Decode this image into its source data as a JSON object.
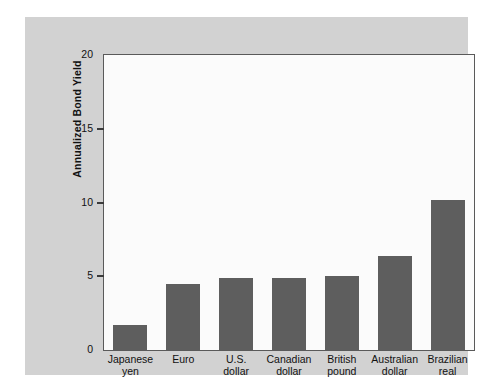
{
  "chart_data": {
    "type": "bar",
    "title": "",
    "subtitle": "",
    "xlabel": "",
    "ylabel": "Annualized Bond Yield",
    "ylim": [
      0,
      20
    ],
    "yticks": [
      0,
      5,
      10,
      15,
      20
    ],
    "ytick_labels": [
      "0",
      "5",
      "10",
      "15",
      "20"
    ],
    "grid": false,
    "legend": false,
    "bar_color": "#5e5e5e",
    "plot_background": "#fbfbfb",
    "figure_background": "#d2d2d2",
    "axis_color": "#5a5a5a",
    "categories": [
      "Japanese yen",
      "Euro",
      "U.S. dollar",
      "Canadian dollar",
      "British pound",
      "Australian dollar",
      "Brazilian real"
    ],
    "category_lines": [
      [
        "Japanese",
        "yen"
      ],
      [
        "Euro",
        ""
      ],
      [
        "U.S.",
        "dollar"
      ],
      [
        "Canadian",
        "dollar"
      ],
      [
        "British",
        "pound"
      ],
      [
        "Australian",
        "dollar"
      ],
      [
        "Brazilian",
        "real"
      ]
    ],
    "values": [
      1.7,
      4.5,
      4.9,
      4.9,
      5.0,
      6.4,
      10.2
    ]
  }
}
